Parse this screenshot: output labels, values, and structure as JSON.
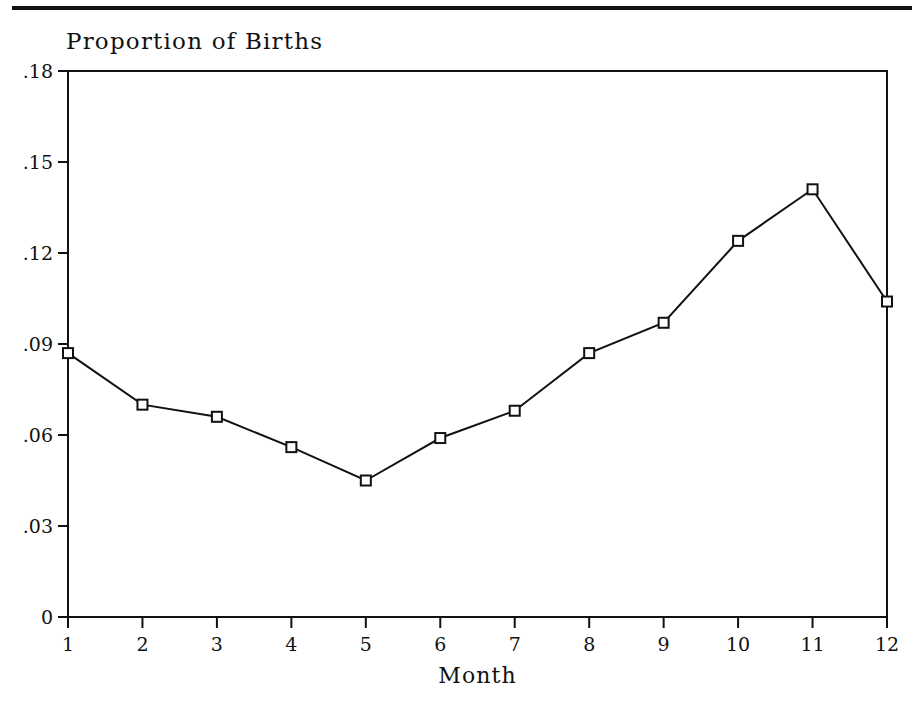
{
  "page": {
    "background_color": "#ffffff",
    "ink_color": "#111111",
    "top_rule": true
  },
  "chart_data": {
    "type": "line",
    "title": "Proportion of Births",
    "xlabel": "Month",
    "ylabel": "",
    "categories": [
      "1",
      "2",
      "3",
      "4",
      "5",
      "6",
      "7",
      "8",
      "9",
      "10",
      "11",
      "12"
    ],
    "x": [
      1,
      2,
      3,
      4,
      5,
      6,
      7,
      8,
      9,
      10,
      11,
      12
    ],
    "values": [
      0.087,
      0.07,
      0.066,
      0.056,
      0.045,
      0.059,
      0.068,
      0.087,
      0.097,
      0.124,
      0.141,
      0.104
    ],
    "xlim": [
      1,
      12
    ],
    "ylim": [
      0,
      0.18
    ],
    "xticks": [
      "1",
      "2",
      "3",
      "4",
      "5",
      "6",
      "7",
      "8",
      "9",
      "10",
      "11",
      "12"
    ],
    "yticks": [
      "0",
      ".03",
      ".06",
      ".09",
      ".12",
      ".15",
      ".18"
    ],
    "ytick_values": [
      0,
      0.03,
      0.06,
      0.09,
      0.12,
      0.15,
      0.18
    ],
    "grid": false,
    "legend": null,
    "marker": "open-square",
    "line_color": "#111111",
    "marker_fill": "#ffffff",
    "marker_stroke": "#111111"
  }
}
